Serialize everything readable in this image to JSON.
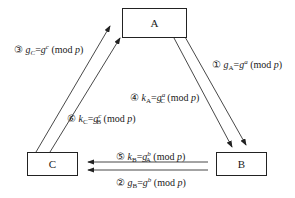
{
  "diagram": {
    "title": "",
    "nodes": [
      {
        "id": "A",
        "label": "A"
      },
      {
        "id": "B",
        "label": "B"
      },
      {
        "id": "C",
        "label": "C"
      }
    ],
    "edges": [
      {
        "step": "①",
        "from": "A",
        "to": "B",
        "label": "gA=g^a (mod p)"
      },
      {
        "step": "②",
        "from": "B",
        "to": "C",
        "label": "gB=g^b (mod p)"
      },
      {
        "step": "③",
        "from": "C",
        "to": "A",
        "label": "gC=g^c (mod p)"
      },
      {
        "step": "④",
        "from": "A",
        "to": "B",
        "label": "kA=gC^a (mod p)"
      },
      {
        "step": "⑤",
        "from": "B",
        "to": "C",
        "label": "kB=gA^b (mod p)"
      },
      {
        "step": "⑥",
        "from": "C",
        "to": "A",
        "label": "kC=gB^c (mod p)"
      }
    ]
  },
  "labels": {
    "e1": {
      "num": "①",
      "lhs": "g",
      "lhs_sub": "A",
      "base": "g",
      "exp": "a",
      "mod": "(mod ",
      "p": "p",
      "close": ")"
    },
    "e2": {
      "num": "②",
      "lhs": "g",
      "lhs_sub": "B",
      "base": "g",
      "exp": "b",
      "mod": "(mod ",
      "p": "p",
      "close": ")"
    },
    "e3": {
      "num": "③",
      "lhs": "g",
      "lhs_sub": "C",
      "base": "g",
      "exp": "c",
      "mod": "(mod ",
      "p": "p",
      "close": ")"
    },
    "e4": {
      "num": "④",
      "lhs": "k",
      "lhs_sub": "A",
      "base": "g",
      "base_sub": "C",
      "exp": "a",
      "mod": "(mod ",
      "p": "p",
      "close": ")"
    },
    "e5": {
      "num": "⑤",
      "lhs": "k",
      "lhs_sub": "B",
      "base": "g",
      "base_sub": "A",
      "exp": "b",
      "mod": "(mod ",
      "p": "p",
      "close": ")"
    },
    "e6": {
      "num": "⑥",
      "lhs": "k",
      "lhs_sub": "C",
      "base": "g",
      "base_sub": "B",
      "exp": "c",
      "mod": "(mod ",
      "p": "p",
      "close": ")"
    }
  }
}
